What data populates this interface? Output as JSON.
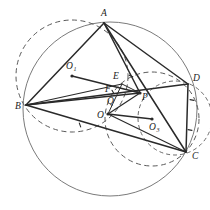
{
  "figure": {
    "background_color": "#ffffff",
    "stroke_color": "#2a2a2a",
    "solid_circle_color": "#6b6b6b",
    "dashed_circle_color": "#5a5a5a",
    "view": {
      "width": 210,
      "height": 210
    }
  },
  "points": [
    {
      "id": "A",
      "label": "A",
      "sub": "",
      "x": 104,
      "y": 23,
      "lx": 101,
      "ly": 16,
      "dot": false
    },
    {
      "id": "B",
      "label": "B",
      "sub": "",
      "x": 26,
      "y": 105,
      "lx": 15,
      "ly": 109,
      "dot": false
    },
    {
      "id": "C",
      "label": "C",
      "sub": "",
      "x": 186,
      "y": 152,
      "lx": 192,
      "ly": 159,
      "dot": false
    },
    {
      "id": "D",
      "label": "D",
      "sub": "",
      "x": 188,
      "y": 84,
      "lx": 193,
      "ly": 81,
      "dot": false
    },
    {
      "id": "E",
      "label": "E",
      "sub": "",
      "x": 122,
      "y": 84,
      "lx": 113,
      "ly": 79,
      "dot": false
    },
    {
      "id": "P",
      "label": "P",
      "sub": "",
      "x": 140,
      "y": 93,
      "lx": 142,
      "ly": 100,
      "dot": true
    },
    {
      "id": "O",
      "label": "O",
      "sub": "",
      "x": 108,
      "y": 114,
      "lx": 97,
      "ly": 118,
      "dot": true
    },
    {
      "id": "O1",
      "label": "O",
      "sub": "1",
      "x": 72,
      "y": 76,
      "lx": 66,
      "ly": 69,
      "dot": true
    },
    {
      "id": "O3",
      "label": "O",
      "sub": "3",
      "x": 152,
      "y": 119,
      "lx": 149,
      "ly": 130,
      "dot": true
    },
    {
      "id": "Q",
      "label": "Q",
      "sub": "",
      "x": 112,
      "y": 101,
      "lx": 107,
      "ly": 104,
      "dot": false
    },
    {
      "id": "F",
      "label": "F",
      "sub": "",
      "x": 110,
      "y": 90,
      "lx": 105,
      "ly": 92,
      "dot": false
    }
  ],
  "circles": [
    {
      "id": "circumcircle-O",
      "name": "main circumcircle through A B C",
      "cx": 110,
      "cy": 109,
      "r": 87,
      "style": "solid",
      "color": "#6b6b6b",
      "width": 0.9
    },
    {
      "id": "circle-O1",
      "name": "dashed circle O1 through A and B",
      "cx": 72,
      "cy": 76,
      "r": 56,
      "style": "dashed",
      "color": "#5a5a5a",
      "width": 1.0,
      "dash": "5,3.5"
    },
    {
      "id": "circle-O3",
      "name": "dashed circle O3 through C and D",
      "cx": 152,
      "cy": 119,
      "r": 47,
      "style": "dashed",
      "color": "#5a5a5a",
      "width": 1.0,
      "dash": "5,3.5"
    },
    {
      "id": "arc-near-D-C",
      "name": "small dashed arc near D and C",
      "cx": 175,
      "cy": 118,
      "r": 37,
      "style": "dashed",
      "color": "#5a5a5a",
      "width": 0.9,
      "dash": "4,3"
    }
  ],
  "segments": [
    {
      "id": "AB",
      "name": "segment-A-B",
      "from": "A",
      "to": "B",
      "width": 1.5
    },
    {
      "id": "AC",
      "name": "segment-A-C",
      "from": "A",
      "to": "C",
      "width": 1.5
    },
    {
      "id": "AD",
      "name": "segment-A-D",
      "from": "A",
      "to": "D",
      "width": 1.5
    },
    {
      "id": "AP",
      "name": "segment-A-P",
      "from": "A",
      "to": "P",
      "width": 1.5
    },
    {
      "id": "BC",
      "name": "segment-B-C",
      "from": "B",
      "to": "C",
      "width": 1.5
    },
    {
      "id": "BD",
      "name": "segment-B-D",
      "from": "B",
      "to": "D",
      "width": 1.5
    },
    {
      "id": "BP",
      "name": "segment-B-P",
      "from": "B",
      "to": "P",
      "width": 1.4
    },
    {
      "id": "DC",
      "name": "segment-D-C",
      "from": "D",
      "to": "C",
      "width": 1.5
    },
    {
      "id": "O1P",
      "name": "segment-O1-P",
      "from": "O1",
      "to": "P",
      "width": 1.4
    },
    {
      "id": "O3O",
      "name": "segment-O3-O",
      "from": "O3",
      "to": "O",
      "width": 1.3
    },
    {
      "id": "OP",
      "name": "segment-O-P",
      "from": "O",
      "to": "P",
      "width": 1.2
    },
    {
      "id": "OE",
      "name": "segment-O-E",
      "from": "O",
      "to": "E",
      "width": 1.0
    },
    {
      "id": "BE",
      "name": "segment-B-E",
      "from": "B",
      "to": "E",
      "width": 1.2
    },
    {
      "id": "EP",
      "name": "segment-E-P",
      "from": "E",
      "to": "P",
      "width": 1.0
    },
    {
      "id": "OC",
      "name": "segment-O-C",
      "from": "O",
      "to": "C",
      "width": 1.2
    }
  ],
  "tick_marks": [
    {
      "id": "tick-1",
      "name": "congruence-tick-on-BD",
      "x": 113,
      "y": 92,
      "angle": 60
    },
    {
      "id": "tick-2",
      "name": "congruence-tick-on-BC",
      "x": 80,
      "y": 125,
      "angle": 70
    },
    {
      "id": "tick-3",
      "name": "congruence-tick-on-DC-upper",
      "x": 192,
      "y": 100,
      "angle": 10
    },
    {
      "id": "tick-4",
      "name": "congruence-tick-on-DC-lower",
      "x": 190,
      "y": 130,
      "angle": 10
    },
    {
      "id": "tick-5",
      "name": "congruence-tick-near-E",
      "x": 131,
      "y": 76,
      "angle": 25
    }
  ]
}
